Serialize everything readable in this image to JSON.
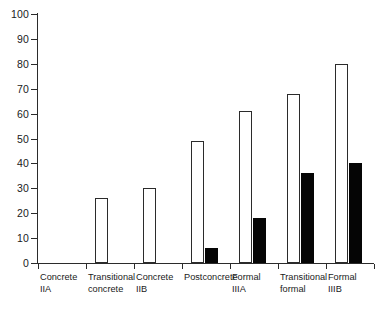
{
  "chart_data": {
    "type": "bar",
    "title": "",
    "subtitle": "",
    "xlabel": "",
    "ylabel": "",
    "ylim": [
      0,
      100
    ],
    "yticks": [
      0,
      10,
      20,
      30,
      40,
      50,
      60,
      70,
      80,
      90,
      100
    ],
    "ytick_labels": [
      "0",
      "10",
      "20",
      "30",
      "40",
      "50",
      "60",
      "70",
      "80",
      "90",
      "100"
    ],
    "grid": false,
    "legend": "none",
    "legend_entries": [],
    "annotations": [],
    "categories": [
      "Concrete\nIIA",
      "Transitional\nconcrete",
      "Concrete\nIIB",
      "Postconcrete",
      "Formal\nIIIA",
      "Transitional\nformal",
      "Formal\nIIIB"
    ],
    "series": [
      {
        "name": "open",
        "style": "hollow",
        "color": "#ffffff",
        "edge_color": "#2b2b2b",
        "values": [
          0,
          26,
          30,
          49,
          61,
          68,
          80
        ]
      },
      {
        "name": "filled",
        "style": "solid",
        "color": "#050505",
        "edge_color": "#050505",
        "values": [
          0,
          0,
          0,
          6,
          18,
          36,
          40
        ]
      }
    ]
  },
  "axis": {
    "y_labels": [
      "100",
      "90",
      "80",
      "70",
      "60",
      "50",
      "40",
      "30",
      "20",
      "10",
      "0"
    ]
  },
  "categories_display": [
    {
      "line1": "Concrete",
      "line2": "IIA"
    },
    {
      "line1": "Transitional",
      "line2": "concrete"
    },
    {
      "line1": "Concrete",
      "line2": "IIB"
    },
    {
      "line1": "Postconcrete",
      "line2": ""
    },
    {
      "line1": "Formal",
      "line2": "IIIA"
    },
    {
      "line1": "Transitional",
      "line2": "formal"
    },
    {
      "line1": "Formal",
      "line2": "IIIB"
    }
  ],
  "colors": {
    "axis": "#2b2b2b",
    "bar_open_fill": "#ffffff",
    "bar_open_edge": "#2b2b2b",
    "bar_filled": "#050505",
    "background": "#ffffff",
    "text": "#1a1a1a"
  }
}
